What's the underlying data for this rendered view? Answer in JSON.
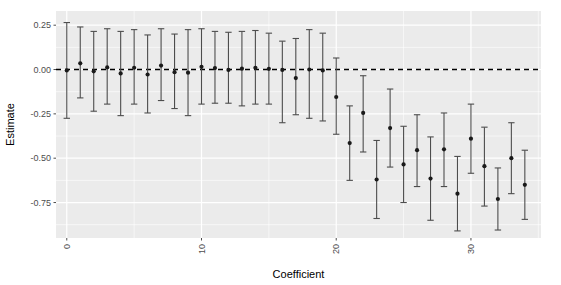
{
  "chart_data": {
    "type": "scatter",
    "title": "",
    "subtitle": "",
    "xlabel": "Coefficient",
    "ylabel": "Estimate",
    "xlim": [
      -0.8,
      35.2
    ],
    "ylim": [
      -0.95,
      0.33
    ],
    "xticks": [
      0,
      10,
      20,
      30
    ],
    "xticklabels": [
      "0",
      "10",
      "20",
      "30"
    ],
    "yticks": [
      0.25,
      0.0,
      -0.25,
      -0.5,
      -0.75
    ],
    "yticklabels": [
      "0.25",
      "0.00",
      "-0.25",
      "-0.50",
      "-0.75"
    ],
    "grid": true,
    "legend": null,
    "legend_position": "none",
    "annotations": [
      {
        "kind": "hline",
        "y": 0.0,
        "style": "dashed",
        "color": "#000000",
        "label": "zero-reference-line"
      }
    ],
    "point_color": "#1a1a1a",
    "errorbar_color": "#4d4d4d",
    "panel_background": "#ebebeb",
    "gridline_color": "#ffffff",
    "x": [
      0,
      1,
      2,
      3,
      4,
      5,
      6,
      7,
      8,
      9,
      10,
      11,
      12,
      13,
      14,
      15,
      16,
      17,
      18,
      19,
      20,
      21,
      22,
      23,
      24,
      25,
      26,
      27,
      28,
      29,
      30,
      31,
      32,
      33,
      34
    ],
    "values": [
      -0.005,
      0.035,
      -0.01,
      0.012,
      -0.022,
      0.01,
      -0.028,
      0.022,
      -0.015,
      -0.018,
      0.015,
      0.008,
      -0.002,
      0.005,
      0.01,
      0.004,
      -0.002,
      -0.048,
      0.0,
      -0.005,
      -0.155,
      -0.415,
      -0.245,
      -0.62,
      -0.33,
      -0.535,
      -0.455,
      -0.615,
      -0.45,
      -0.7,
      -0.39,
      -0.545,
      -0.73,
      -0.5,
      -0.65
    ],
    "ci_lower": [
      -0.275,
      -0.16,
      -0.235,
      -0.195,
      -0.26,
      -0.195,
      -0.245,
      -0.175,
      -0.22,
      -0.26,
      -0.195,
      -0.19,
      -0.19,
      -0.205,
      -0.195,
      -0.195,
      -0.3,
      -0.255,
      -0.275,
      -0.29,
      -0.365,
      -0.625,
      -0.465,
      -0.84,
      -0.55,
      -0.75,
      -0.66,
      -0.85,
      -0.66,
      -0.91,
      -0.585,
      -0.77,
      -0.905,
      -0.7,
      -0.845
    ],
    "ci_upper": [
      0.265,
      0.24,
      0.215,
      0.23,
      0.215,
      0.225,
      0.195,
      0.23,
      0.2,
      0.225,
      0.23,
      0.215,
      0.21,
      0.215,
      0.22,
      0.205,
      0.16,
      0.175,
      0.225,
      0.205,
      0.065,
      -0.205,
      -0.035,
      -0.4,
      -0.11,
      -0.32,
      -0.255,
      -0.38,
      -0.245,
      -0.49,
      -0.195,
      -0.325,
      -0.555,
      -0.3,
      -0.455
    ],
    "n_points": 35
  }
}
